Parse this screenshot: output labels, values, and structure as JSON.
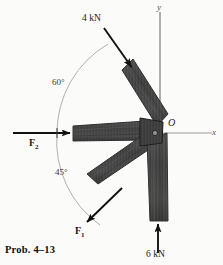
{
  "figure": {
    "caption": "Prob. 4–13",
    "origin_label": "O",
    "axes": {
      "x_label": "x",
      "y_label": "y"
    },
    "forces": [
      {
        "name": "force-4kn",
        "label": "4 kN",
        "magnitude": 4,
        "unit": "kN",
        "direction_deg": 300,
        "description": "applied at 60 degrees above negative x-axis, pointing down-right into upper member"
      },
      {
        "name": "force-f2",
        "label": "F",
        "subscript": "2",
        "direction_deg": 0,
        "description": "horizontal force pointing right along negative x-axis member"
      },
      {
        "name": "force-f1",
        "label": "F",
        "subscript": "1",
        "direction_deg": 225,
        "description": "at 45 degrees below negative x-axis, pointing down-left"
      },
      {
        "name": "force-6kn",
        "label": "6 kN",
        "magnitude": 6,
        "unit": "kN",
        "direction_deg": 90,
        "description": "vertical force pointing up into lower vertical member"
      }
    ],
    "angles": [
      {
        "name": "angle-60",
        "label": "60°",
        "value": 60
      },
      {
        "name": "angle-45",
        "label": "45°",
        "value": 45
      }
    ],
    "colors": {
      "member_fill": "#4a4a4a",
      "member_dark": "#2e2e2e",
      "arrow": "#111111",
      "axis": "#8a8a8a",
      "arc": "#9a9a9a",
      "background": "#fbfbf9"
    }
  }
}
